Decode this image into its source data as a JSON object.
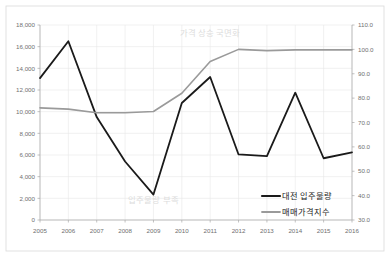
{
  "chart_data": {
    "type": "line",
    "title": "",
    "xlabel": "",
    "ylabel": "",
    "y2label": "",
    "grid": true,
    "legend_position": "inside-bottom-right",
    "categories": [
      "2005",
      "2006",
      "2007",
      "2008",
      "2009",
      "2010",
      "2011",
      "2012",
      "2013",
      "2014",
      "2015",
      "2016"
    ],
    "ylim": [
      0,
      18000
    ],
    "yticks": [
      "0",
      "2,000",
      "4,000",
      "6,000",
      "8,000",
      "10,000",
      "12,000",
      "14,000",
      "16,000",
      "18,000"
    ],
    "ytick_values": [
      0,
      2000,
      4000,
      6000,
      8000,
      10000,
      12000,
      14000,
      16000,
      18000
    ],
    "y2lim": [
      30.0,
      110.0
    ],
    "y2ticks": [
      "30.0",
      "40.0",
      "50.0",
      "60.0",
      "70.0",
      "80.0",
      "90.0",
      "100.0",
      "110.0"
    ],
    "y2tick_values": [
      30.0,
      40.0,
      50.0,
      60.0,
      70.0,
      80.0,
      90.0,
      100.0,
      110.0
    ],
    "series": [
      {
        "name": "대전 입주물량",
        "axis": "left",
        "color": "#1a1a1a",
        "width": 1.8,
        "values": [
          13100,
          16500,
          9500,
          5400,
          2350,
          10800,
          13200,
          6050,
          5900,
          11750,
          5700,
          6250
        ]
      },
      {
        "name": "매매가격지수",
        "axis": "right",
        "color": "#9a9a9a",
        "width": 1.6,
        "values": [
          76.0,
          75.5,
          74.0,
          74.0,
          74.5,
          82.0,
          95.0,
          100.0,
          99.5,
          99.8,
          99.8,
          99.8
        ]
      }
    ],
    "annotations": [
      {
        "text": "가격 상승 국면화",
        "x_category": "2011",
        "y_value": 17000,
        "color": "#dcdcdc"
      },
      {
        "text": "입주물량 부족",
        "x_category": "2009",
        "y_value": 1600,
        "color": "#dcdcdc"
      }
    ]
  },
  "legend": {
    "items": [
      {
        "label": "대전 입주물량",
        "color": "#1a1a1a"
      },
      {
        "label": "매매가격지수",
        "color": "#9a9a9a"
      }
    ]
  }
}
